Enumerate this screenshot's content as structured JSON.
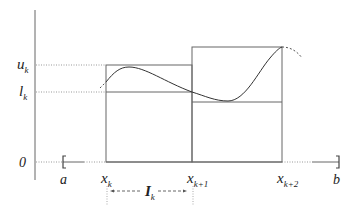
{
  "figure": {
    "labels": {
      "u_k": {
        "base": "u",
        "sub": "k"
      },
      "l_k": {
        "base": "l",
        "sub": "k"
      },
      "zero": "0",
      "a": "a",
      "b": "b",
      "x_k": {
        "base": "x",
        "sub": "k"
      },
      "x_k1": {
        "base": "x",
        "sub": "k+1"
      },
      "x_k2": {
        "base": "x",
        "sub": "k+2"
      },
      "I_k": {
        "base": "I",
        "sub": "k"
      }
    },
    "colors": {
      "line": "#555555",
      "curve": "#333333",
      "dotted": "#888888"
    }
  }
}
